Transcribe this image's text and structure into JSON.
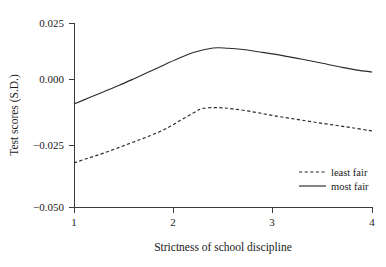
{
  "chart_data": {
    "type": "line",
    "title": "",
    "xlabel": "Strictness of school discipline",
    "ylabel": "Test scores (S.D.)",
    "xlim": [
      1,
      4
    ],
    "ylim": [
      -0.05,
      0.025
    ],
    "grid": false,
    "legend_position": "bottom-right",
    "xticks": [
      1,
      2,
      3,
      4
    ],
    "xtick_labels": [
      "1",
      "2",
      "3",
      "4"
    ],
    "yticks": [
      0.025,
      0.0,
      -0.025,
      -0.05
    ],
    "ytick_labels": [
      "0.025",
      "0.000",
      "−0.025",
      "−0.050"
    ],
    "series": [
      {
        "name": "least fair",
        "style": "dashed",
        "color": "#2b2b2b",
        "x": [
          1.0,
          1.15,
          1.3,
          1.45,
          1.6,
          1.75,
          1.9,
          2.05,
          2.2,
          2.3,
          2.45,
          2.6,
          2.8,
          3.0,
          3.2,
          3.4,
          3.6,
          3.8,
          4.0
        ],
        "values": [
          -0.032,
          -0.03,
          -0.028,
          -0.0258,
          -0.0235,
          -0.0212,
          -0.0186,
          -0.0152,
          -0.0117,
          -0.0098,
          -0.0095,
          -0.01,
          -0.0112,
          -0.0127,
          -0.014,
          -0.0153,
          -0.0165,
          -0.0177,
          -0.019
        ]
      },
      {
        "name": "most fair",
        "style": "solid",
        "color": "#2b2b2b",
        "x": [
          1.0,
          1.15,
          1.3,
          1.45,
          1.6,
          1.75,
          1.9,
          2.05,
          2.2,
          2.4,
          2.55,
          2.7,
          2.9,
          3.1,
          3.3,
          3.5,
          3.7,
          3.85,
          4.0
        ],
        "values": [
          -0.008,
          -0.0055,
          -0.003,
          -0.0005,
          0.0022,
          0.005,
          0.0078,
          0.0105,
          0.013,
          0.0148,
          0.0147,
          0.0142,
          0.013,
          0.0117,
          0.0102,
          0.0086,
          0.0069,
          0.0058,
          0.005
        ]
      }
    ]
  },
  "legend": {
    "entries": [
      {
        "label": "least fair",
        "style": "dashed"
      },
      {
        "label": "most fair",
        "style": "solid"
      }
    ]
  },
  "axes": {
    "y_title": "Test scores (S.D.)",
    "x_title": "Strictness of school discipline",
    "y_labels": [
      "0.025",
      "0.000",
      "−0.025",
      "−0.050"
    ],
    "x_labels": [
      "1",
      "2",
      "3",
      "4"
    ]
  }
}
